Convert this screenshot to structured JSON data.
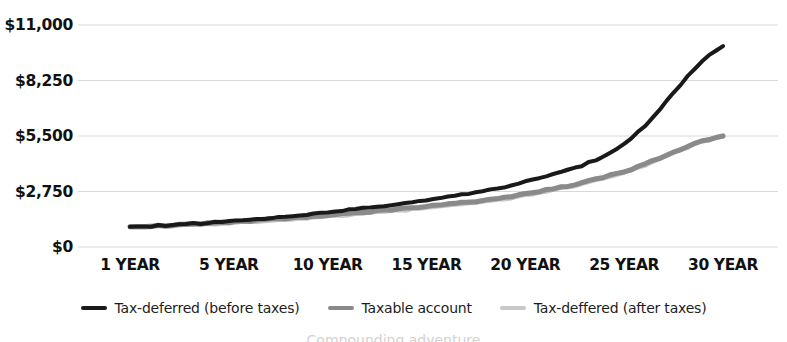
{
  "chart_data": {
    "type": "line",
    "title": "",
    "subtitle": "",
    "xlabel": "",
    "ylabel": "",
    "grid": true,
    "legend_position": "bottom",
    "x": [
      1,
      5,
      10,
      15,
      20,
      25,
      30
    ],
    "x_tick_labels": [
      "1 YEAR",
      "5 YEAR",
      "10 YEAR",
      "15 YEAR",
      "20 YEAR",
      "25 YEAR",
      "30 YEAR"
    ],
    "y_tick_labels": [
      "$11,000",
      "$8,250",
      "$5,500",
      "$2,750",
      "$0"
    ],
    "y_tick_values": [
      11000,
      8250,
      5500,
      2750,
      0
    ],
    "ylim": [
      0,
      11000
    ],
    "xlim": [
      1,
      30
    ],
    "series": [
      {
        "name": "Tax-deferred (before taxes)",
        "color": "#1a1a1a",
        "width": 4,
        "values": [
          1000,
          1280,
          1720,
          2330,
          3230,
          5100,
          9950
        ]
      },
      {
        "name": "Taxable account",
        "color": "#8a8a8a",
        "width": 5,
        "values": [
          1000,
          1230,
          1580,
          2010,
          2620,
          3750,
          5500
        ]
      },
      {
        "name": "Tax-deffered (after taxes)",
        "color": "#c8c8c8",
        "width": 5,
        "values": [
          1000,
          1210,
          1540,
          1960,
          2570,
          3700,
          5500
        ]
      }
    ]
  },
  "legend": {
    "items": [
      {
        "label": "Tax-deferred (before taxes)",
        "color": "#1a1a1a"
      },
      {
        "label": "Taxable account",
        "color": "#8a8a8a"
      },
      {
        "label": "Tax-deffered (after taxes)",
        "color": "#c8c8c8"
      }
    ]
  },
  "footer": {
    "clipped_text": "Compounding adventure"
  },
  "style": {
    "background": "#ffffff",
    "gridline_color": "#d9d9d9",
    "text_color": "#111111"
  }
}
